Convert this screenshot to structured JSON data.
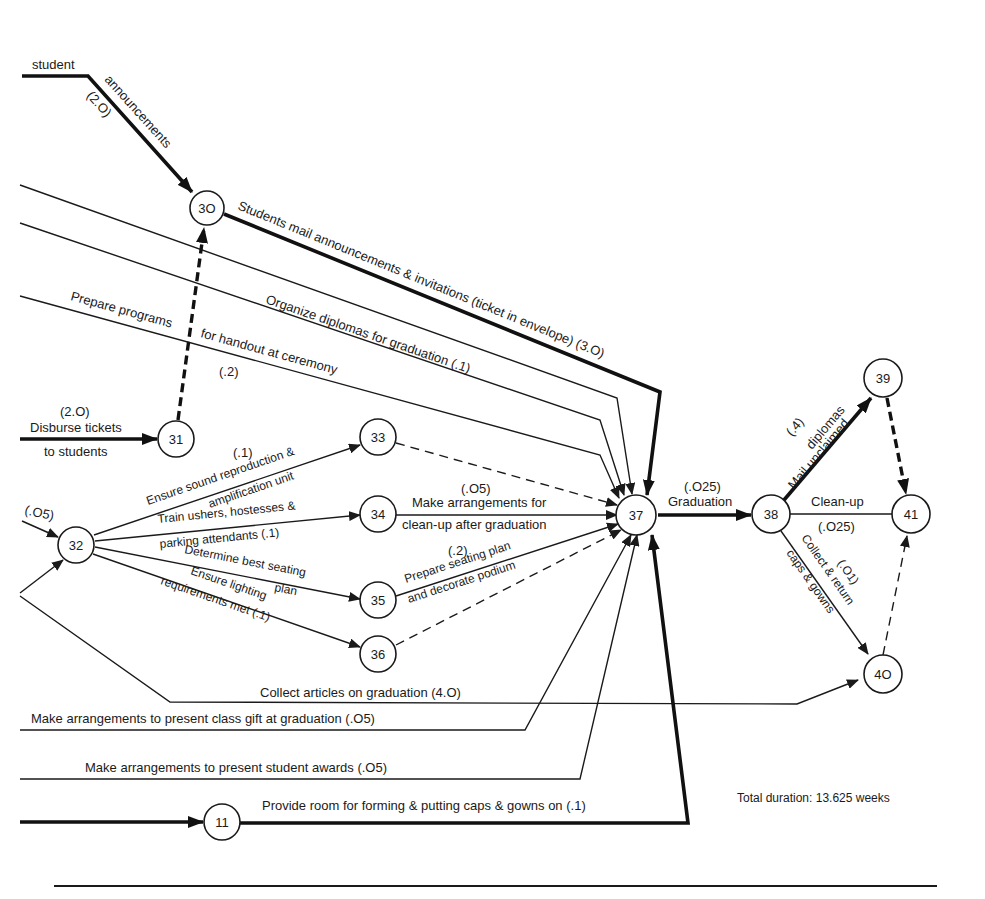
{
  "diagram": {
    "type": "PERT network (activity-on-arrow)",
    "nodes": [
      {
        "id": "30",
        "label": "3O"
      },
      {
        "id": "31",
        "label": "31"
      },
      {
        "id": "32",
        "label": "32"
      },
      {
        "id": "33",
        "label": "33"
      },
      {
        "id": "34",
        "label": "34"
      },
      {
        "id": "35",
        "label": "35"
      },
      {
        "id": "36",
        "label": "36"
      },
      {
        "id": "37",
        "label": "37"
      },
      {
        "id": "38",
        "label": "38"
      },
      {
        "id": "39",
        "label": "39"
      },
      {
        "id": "40",
        "label": "4O"
      },
      {
        "id": "41",
        "label": "41"
      },
      {
        "id": "11",
        "label": "11"
      }
    ],
    "activities": {
      "student_announcements": {
        "line1": "student",
        "line2": "announcements",
        "duration": "(2.O)",
        "to": "30",
        "critical": true
      },
      "mail_announcements": {
        "label": "Students mail announcements & invitations (ticket in envelope) (3.O)",
        "from": "30",
        "to": "37",
        "critical": true
      },
      "organize_diplomas": {
        "label": "Organize diplomas for graduation (.1)",
        "to": "37"
      },
      "prepare_programs": {
        "line1": "Prepare programs",
        "line2": "for handout at ceremony",
        "duration": "(.2)",
        "to": "37"
      },
      "disburse_tickets": {
        "duration": "(2.O)",
        "line1": "Disburse tickets",
        "line2": "to students",
        "to": "31",
        "critical": true
      },
      "dummy_31_30": {
        "from": "31",
        "to": "30",
        "dummy": true,
        "critical": true
      },
      "into_32": {
        "duration": "(.O5)",
        "to": "32"
      },
      "sound": {
        "duration": "(.1)",
        "line1": "Ensure sound reproduction &",
        "line2": "amplification unit",
        "from": "32",
        "to": "33"
      },
      "ushers": {
        "line1": "Train ushers, hostesses &",
        "line2": "parking attendants (.1)",
        "from": "32",
        "to": "34"
      },
      "seating": {
        "line1": "Determine best seating",
        "line2": "plan",
        "from": "32",
        "to": "35"
      },
      "lighting": {
        "line1": "Ensure lighting",
        "line2": "requirements met (.1)",
        "from": "32",
        "to": "36"
      },
      "cleanup_arrange": {
        "duration": "(.O5)",
        "line1": "Make arrangements for",
        "line2": "clean-up after graduation",
        "from": "34",
        "to": "37"
      },
      "seating_plan": {
        "duration": "(.2)",
        "line1": "Prepare seating plan",
        "line2": "and decorate podium",
        "from": "35",
        "to": "37"
      },
      "collect_articles": {
        "label": "Collect articles on graduation (4.O)",
        "to": "40"
      },
      "class_gift": {
        "label": "Make arrangements to present class gift at graduation (.O5)",
        "to": "37"
      },
      "student_awards": {
        "label": "Make arrangements to present student awards (.O5)",
        "to": "37"
      },
      "caps_room": {
        "label": "Provide room for forming & putting caps & gowns on (.1)",
        "from": "11",
        "to": "37",
        "critical": true
      },
      "graduation": {
        "duration": "(.O25)",
        "label": "Graduation",
        "from": "37",
        "to": "38",
        "critical": true
      },
      "mail_diplomas": {
        "duration": "(.4)",
        "line1": "Mail unclaimed",
        "line2": "diplomas",
        "from": "38",
        "to": "39",
        "critical": true
      },
      "cleanup": {
        "label": "Clean-up",
        "duration": "(.O25)",
        "from": "38",
        "to": "41"
      },
      "caps_gowns": {
        "duration": "(.O1)",
        "line1": "Collect & return",
        "line2": "caps & gowns",
        "from": "38",
        "to": "40"
      }
    },
    "total_duration": "Total duration: 13.625 weeks",
    "colors": {
      "ink": "#1a1a1a",
      "background": "#ffffff"
    }
  }
}
